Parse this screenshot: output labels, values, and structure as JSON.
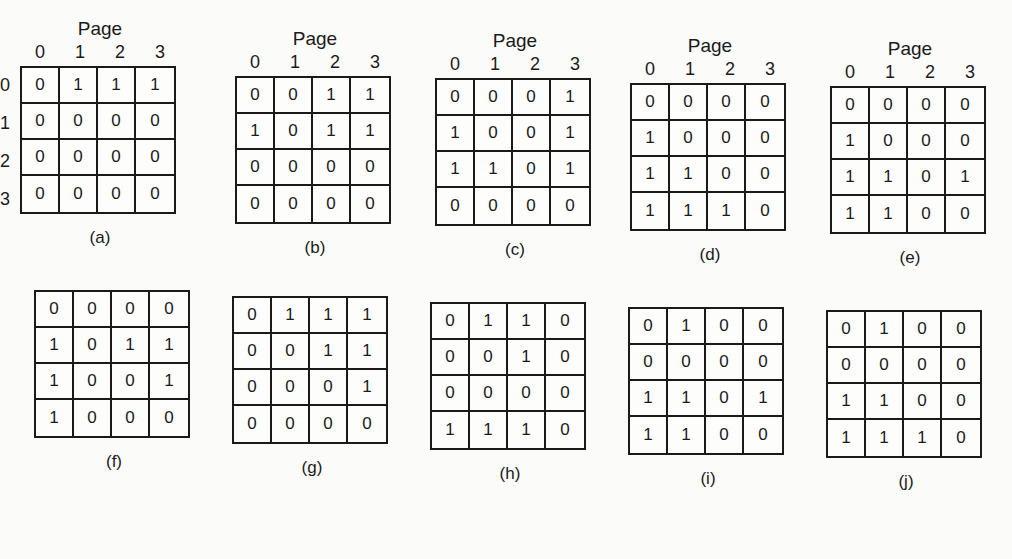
{
  "figure": {
    "header_label": "Page",
    "col_indices": [
      "0",
      "1",
      "2",
      "3"
    ],
    "row_indices": [
      "0",
      "1",
      "2",
      "3"
    ],
    "panels": [
      {
        "caption": "(a)",
        "matrix": [
          [
            "0",
            "1",
            "1",
            "1"
          ],
          [
            "0",
            "0",
            "0",
            "0"
          ],
          [
            "0",
            "0",
            "0",
            "0"
          ],
          [
            "0",
            "0",
            "0",
            "0"
          ]
        ]
      },
      {
        "caption": "(b)",
        "matrix": [
          [
            "0",
            "0",
            "1",
            "1"
          ],
          [
            "1",
            "0",
            "1",
            "1"
          ],
          [
            "0",
            "0",
            "0",
            "0"
          ],
          [
            "0",
            "0",
            "0",
            "0"
          ]
        ]
      },
      {
        "caption": "(c)",
        "matrix": [
          [
            "0",
            "0",
            "0",
            "1"
          ],
          [
            "1",
            "0",
            "0",
            "1"
          ],
          [
            "1",
            "1",
            "0",
            "1"
          ],
          [
            "0",
            "0",
            "0",
            "0"
          ]
        ]
      },
      {
        "caption": "(d)",
        "matrix": [
          [
            "0",
            "0",
            "0",
            "0"
          ],
          [
            "1",
            "0",
            "0",
            "0"
          ],
          [
            "1",
            "1",
            "0",
            "0"
          ],
          [
            "1",
            "1",
            "1",
            "0"
          ]
        ]
      },
      {
        "caption": "(e)",
        "matrix": [
          [
            "0",
            "0",
            "0",
            "0"
          ],
          [
            "1",
            "0",
            "0",
            "0"
          ],
          [
            "1",
            "1",
            "0",
            "1"
          ],
          [
            "1",
            "1",
            "0",
            "0"
          ]
        ]
      },
      {
        "caption": "(f)",
        "matrix": [
          [
            "0",
            "0",
            "0",
            "0"
          ],
          [
            "1",
            "0",
            "1",
            "1"
          ],
          [
            "1",
            "0",
            "0",
            "1"
          ],
          [
            "1",
            "0",
            "0",
            "0"
          ]
        ]
      },
      {
        "caption": "(g)",
        "matrix": [
          [
            "0",
            "1",
            "1",
            "1"
          ],
          [
            "0",
            "0",
            "1",
            "1"
          ],
          [
            "0",
            "0",
            "0",
            "1"
          ],
          [
            "0",
            "0",
            "0",
            "0"
          ]
        ]
      },
      {
        "caption": "(h)",
        "matrix": [
          [
            "0",
            "1",
            "1",
            "0"
          ],
          [
            "0",
            "0",
            "1",
            "0"
          ],
          [
            "0",
            "0",
            "0",
            "0"
          ],
          [
            "1",
            "1",
            "1",
            "0"
          ]
        ]
      },
      {
        "caption": "(i)",
        "matrix": [
          [
            "0",
            "1",
            "0",
            "0"
          ],
          [
            "0",
            "0",
            "0",
            "0"
          ],
          [
            "1",
            "1",
            "0",
            "1"
          ],
          [
            "1",
            "1",
            "0",
            "0"
          ]
        ]
      },
      {
        "caption": "(j)",
        "matrix": [
          [
            "0",
            "1",
            "0",
            "0"
          ],
          [
            "0",
            "0",
            "0",
            "0"
          ],
          [
            "1",
            "1",
            "0",
            "0"
          ],
          [
            "1",
            "1",
            "1",
            "0"
          ]
        ]
      }
    ]
  }
}
